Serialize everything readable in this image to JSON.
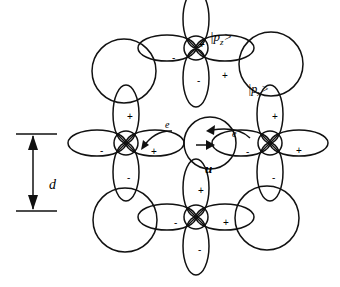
{
  "labels": {
    "pz": "|p",
    "pz_sub": "z",
    "pz_end": ">",
    "px": "|p",
    "px_sub": "x",
    "px_end": ">",
    "d": "d",
    "u": "u",
    "e1": "e",
    "e2": "e"
  },
  "signs": {
    "top_up": "+",
    "top_down": "-",
    "top_left": "-",
    "top_right": "+",
    "left_up": "+",
    "left_down": "-",
    "left_left": "-",
    "left_right": "+",
    "right_up": "+",
    "right_down": "-",
    "right_left": "-",
    "right_right": "+",
    "bottom_up": "+",
    "bottom_down": "-",
    "bottom_left": "-",
    "bottom_right": "+"
  },
  "colors": {
    "stroke": "#111111",
    "background": "#ffffff"
  }
}
